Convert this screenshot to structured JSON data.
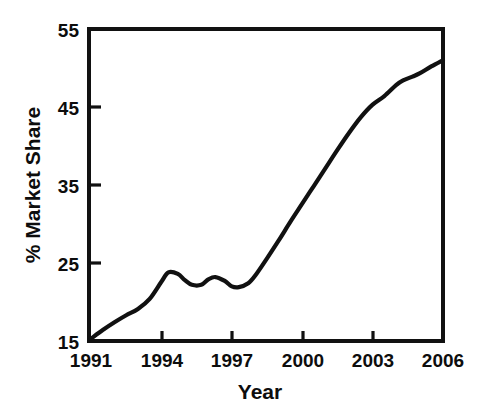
{
  "figure": {
    "background_color": "#ffffff",
    "line_color": "#111111",
    "text_color": "#0d0d0d"
  },
  "axis": {
    "x_title": "Year",
    "y_title": "% Market Share",
    "x_ticks": [
      "1991",
      "1994",
      "1997",
      "2000",
      "2003",
      "2006"
    ],
    "y_ticks": [
      "15",
      "25",
      "35",
      "45",
      "55"
    ]
  },
  "chart_data": {
    "type": "line",
    "title": "",
    "xlabel": "Year",
    "ylabel": "% Market Share",
    "xlim": [
      1991,
      2006
    ],
    "ylim": [
      15,
      55
    ],
    "xticks": [
      1991,
      1994,
      1997,
      2000,
      2003,
      2006
    ],
    "yticks": [
      15,
      25,
      35,
      45,
      55
    ],
    "grid": false,
    "legend": false,
    "series": [
      {
        "name": "% Market Share",
        "x": [
          1991,
          1991.5,
          1992,
          1992.5,
          1993,
          1993.5,
          1994,
          1994.3,
          1994.7,
          1995,
          1995.3,
          1995.7,
          1996,
          1996.3,
          1996.7,
          1997,
          1997.3,
          1997.7,
          1998,
          1998.5,
          1999,
          1999.5,
          2000,
          2000.5,
          2001,
          2001.5,
          2002,
          2002.5,
          2003,
          2003.5,
          2004,
          2004.3,
          2004.7,
          2005,
          2005.5,
          2006
        ],
        "y": [
          15.3,
          16.4,
          17.4,
          18.3,
          19.1,
          20.4,
          22.6,
          23.8,
          23.6,
          22.8,
          22.2,
          22.2,
          22.9,
          23.2,
          22.7,
          22.0,
          21.9,
          22.4,
          23.4,
          25.6,
          27.9,
          30.3,
          32.6,
          34.9,
          37.2,
          39.5,
          41.7,
          43.7,
          45.3,
          46.4,
          47.8,
          48.4,
          48.9,
          49.3,
          50.2,
          51.0
        ]
      }
    ]
  }
}
